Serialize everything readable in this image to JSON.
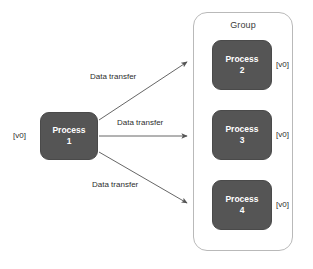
{
  "canvas": {
    "width": 313,
    "height": 269,
    "background": "#ffffff"
  },
  "theme": {
    "process_fill": "#555555",
    "process_text": "#ffffff",
    "group_border": "#b9b9b9",
    "edge_color": "#555555",
    "label_text": "#2d2d2d"
  },
  "group": {
    "title": "Group",
    "processes": [
      {
        "name": "Process",
        "number": "2",
        "version": "[v0]"
      },
      {
        "name": "Process",
        "number": "3",
        "version": "[v0]"
      },
      {
        "name": "Process",
        "number": "4",
        "version": "[v0]"
      }
    ]
  },
  "source": {
    "process": {
      "name": "Process",
      "number": "1",
      "version": "[v0]"
    }
  },
  "edges": [
    {
      "label": "Data transfer",
      "from": "Process 1",
      "to": "Process 2",
      "direction": "up-right"
    },
    {
      "label": "Data transfer",
      "from": "Process 1",
      "to": "Process 3",
      "direction": "right"
    },
    {
      "label": "Data transfer",
      "from": "Process 1",
      "to": "Process 4",
      "direction": "down-right"
    }
  ]
}
